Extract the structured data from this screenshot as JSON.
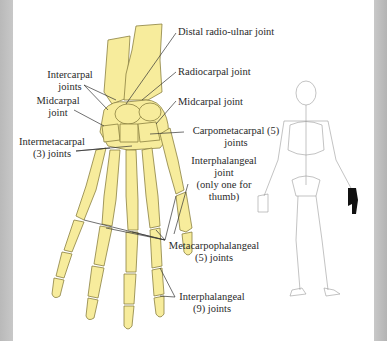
{
  "figure": {
    "colors": {
      "bone_fill": "#f7ec9c",
      "bone_outline": "#8a8040",
      "leader_line": "#333333",
      "side_border": "#c0c0c0",
      "skeleton_line": "#9a9a9a",
      "highlight_hand": "#111111"
    }
  },
  "labels": {
    "distal_radio_ulnar": "Distal radio-ulnar joint",
    "radiocarpal": "Radiocarpal joint",
    "midcarpal_right": "Midcarpal joint",
    "intercarpal_line1": "Intercarpal",
    "intercarpal_line2": "joints",
    "midcarpal_left_line1": "Midcarpal",
    "midcarpal_left_line2": "joint",
    "intermetacarpal_line1": "Intermetacarpal",
    "intermetacarpal_line2": "(3) joints",
    "carpometacarpal_line1": "Carpometacarpal (5)",
    "carpometacarpal_line2": "joints",
    "interphalangeal_thumb_line1": "Interphalangeal",
    "interphalangeal_thumb_line2": "joint",
    "interphalangeal_thumb_line3": "(only one for",
    "interphalangeal_thumb_line4": "thumb)",
    "metacarpophalangeal_line1": "Metacarpophalangeal",
    "metacarpophalangeal_line2": "(5) joints",
    "interphalangeal_line1": "Interphalangeal",
    "interphalangeal_line2": "(9) joints"
  },
  "inset": {
    "description": "Full skeleton posterior view with left hand highlighted in black"
  }
}
